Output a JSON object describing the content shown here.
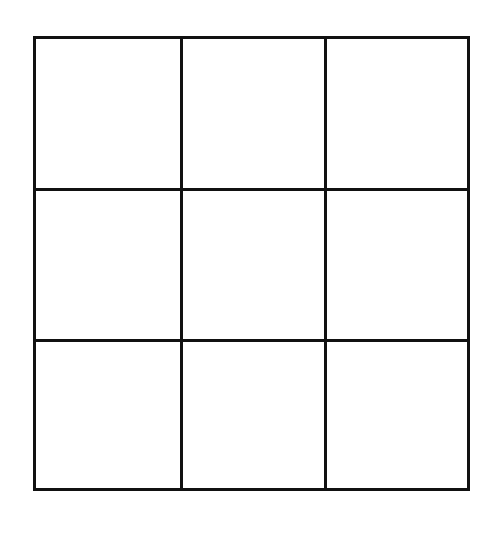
{
  "game": {
    "type": "tic-tac-toe",
    "rows": 3,
    "cols": 3,
    "line_color": "#111111",
    "background": "#ffffff",
    "cells": [
      {
        "row": 0,
        "col": 0,
        "mark": ""
      },
      {
        "row": 0,
        "col": 1,
        "mark": ""
      },
      {
        "row": 0,
        "col": 2,
        "mark": ""
      },
      {
        "row": 1,
        "col": 0,
        "mark": ""
      },
      {
        "row": 1,
        "col": 1,
        "mark": ""
      },
      {
        "row": 1,
        "col": 2,
        "mark": ""
      },
      {
        "row": 2,
        "col": 0,
        "mark": ""
      },
      {
        "row": 2,
        "col": 1,
        "mark": ""
      },
      {
        "row": 2,
        "col": 2,
        "mark": ""
      }
    ]
  }
}
